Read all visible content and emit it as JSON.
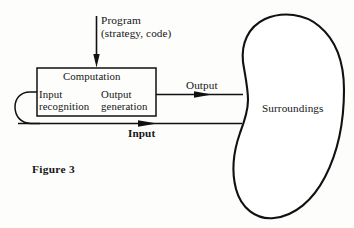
{
  "figure": {
    "caption": "Figure 3",
    "background_color": "#fdfdfc",
    "ink_color": "#111111"
  },
  "diagram": {
    "program_input": {
      "line1": "Program",
      "line2": "(strategy, code)",
      "arrow": "down-arrow-icon"
    },
    "computation_box": {
      "title": "Computation",
      "left_stage": {
        "line1": "Input",
        "line2": "recognition"
      },
      "right_stage": {
        "line1": "Output",
        "line2": "generation"
      }
    },
    "flows": {
      "output": {
        "label": "Output",
        "direction": "right",
        "arrow": "right-arrow-icon"
      },
      "input": {
        "label": "Input",
        "direction": "right",
        "arrow": "right-arrow-icon"
      },
      "feedback_loop": {
        "label": "",
        "shape": "left-loop-icon"
      }
    },
    "environment": {
      "label": "Surroundings",
      "shape": "kidney-blob-icon"
    }
  }
}
